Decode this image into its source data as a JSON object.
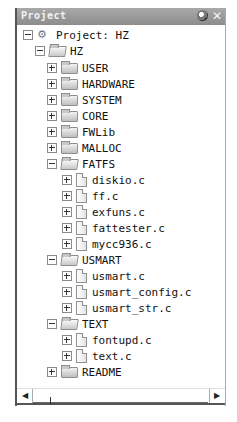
{
  "panel": {
    "title": "Project",
    "icons": [
      "pin-icon",
      "close-icon"
    ],
    "close_glyph": "✕"
  },
  "tree": {
    "root": {
      "label": "Project: HZ",
      "expanded": true
    },
    "target": {
      "label": "HZ",
      "expanded": true
    },
    "groups": [
      {
        "label": "USER",
        "expanded": false
      },
      {
        "label": "HARDWARE",
        "expanded": false
      },
      {
        "label": "SYSTEM",
        "expanded": false
      },
      {
        "label": "CORE",
        "expanded": false
      },
      {
        "label": "FWLib",
        "expanded": false
      },
      {
        "label": "MALLOC",
        "expanded": false
      },
      {
        "label": "FATFS",
        "expanded": true,
        "files": [
          "diskio.c",
          "ff.c",
          "exfuns.c",
          "fattester.c",
          "mycc936.c"
        ]
      },
      {
        "label": "USMART",
        "expanded": true,
        "files": [
          "usmart.c",
          "usmart_config.c",
          "usmart_str.c"
        ]
      },
      {
        "label": "TEXT",
        "expanded": true,
        "files": [
          "fontupd.c",
          "text.c"
        ]
      },
      {
        "label": "README",
        "expanded": false
      }
    ]
  },
  "scrollbar": {
    "left_arrow": "◀",
    "right_arrow": "▶"
  }
}
